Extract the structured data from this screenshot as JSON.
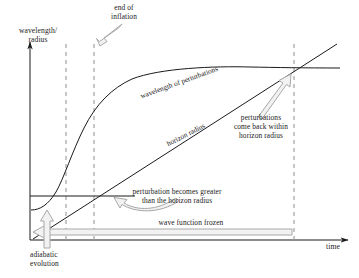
{
  "figure": {
    "type": "schematic-diagram",
    "background_color": "#ffffff",
    "line_color": "#1a1a1a",
    "dashed_color": "#9a9a9a",
    "callout_color": "#a8a8a8"
  },
  "axes": {
    "y_label": "wavelength/\nradius",
    "x_label": "time",
    "y_axis_name": "wavelength-radius-axis",
    "x_axis_name": "time-axis",
    "origin": [
      30,
      240
    ],
    "x_axis_end": [
      352,
      240
    ],
    "y_axis_top": [
      30,
      38
    ]
  },
  "curves": [
    {
      "name": "wavelength-of-perturbations",
      "label": "wavelength of perturbations",
      "label_angle_deg": -20,
      "description": "starts low, rises steeply during inflation, then flattens out"
    },
    {
      "name": "horizon-radius",
      "label": "horizon radius",
      "label_angle_deg": -27,
      "description": "straight line rising steadily, crosses wavelength curve at right dashed line"
    }
  ],
  "markers": {
    "dashed_lines": [
      {
        "name": "start-of-inflation-line",
        "x": 66
      },
      {
        "name": "end-of-inflation-line",
        "x": 94
      },
      {
        "name": "horizon-reentry-line",
        "x": 294
      }
    ],
    "horizontal_segment": {
      "name": "initial-horizon-level",
      "y": 196,
      "x_start": 30,
      "x_end": 135
    }
  },
  "annotations": [
    {
      "name": "end-of-inflation-annotation",
      "text": "end of\ninflation",
      "x": 96,
      "y": 4
    },
    {
      "name": "perturbations-reenter-annotation",
      "text": "perturbations\ncome back within\nhorizon radius",
      "x": 222,
      "y": 114
    },
    {
      "name": "perturbation-greater-annotation",
      "text": "perturbation becomes greater\nthan the horizon radius",
      "x": 110,
      "y": 188
    },
    {
      "name": "wave-function-frozen-annotation",
      "text": "wave function frozen",
      "x": 143,
      "y": 219
    },
    {
      "name": "adiabatic-evolution-annotation",
      "text": "adiabatic\nevolution",
      "x": 34,
      "y": 252
    }
  ]
}
